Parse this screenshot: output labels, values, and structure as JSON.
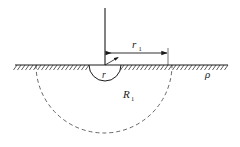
{
  "figure": {
    "background_color": "#ffffff",
    "stroke_color": "#1a1a1a",
    "width": 240,
    "height": 147
  },
  "labels": {
    "outer_radius": {
      "base": "r",
      "subscript": "1"
    },
    "inner_radius": {
      "base": "r",
      "subscript": ""
    },
    "hemisphere_radius": {
      "base": "R",
      "subscript": "1"
    },
    "soil_resistivity": {
      "base": "ρ",
      "subscript": ""
    }
  },
  "elements": {
    "ground_surface": {
      "name": "ground-surface-line",
      "x_start": 15,
      "x_end": 228,
      "y": 65,
      "hatch_side": "below",
      "hatch_spacing": 4,
      "hatch_length": 5
    },
    "vertical_lead": {
      "name": "vertical-lead-line",
      "x": 105,
      "y_top": 8,
      "y_bottom": 65
    },
    "dimension_arrow": {
      "name": "r1-dimension-arrow",
      "x_start": 105,
      "x_end": 168,
      "y": 53,
      "double_headed": true
    },
    "inner_semicircle": {
      "name": "inner-electrode-semicircle",
      "center_x": 105,
      "center_y": 65,
      "radius": 16,
      "style": "solid"
    },
    "inner_radius_arrow": {
      "name": "r-radius-arrow",
      "from_x": 105,
      "from_y": 65,
      "to_x": 119,
      "to_y": 57
    },
    "outer_semicircle": {
      "name": "outer-hemisphere-dashed-arc",
      "center_x": 104,
      "center_y": 65,
      "radius": 68,
      "style": "dashed",
      "dash_pattern": "4 3"
    }
  },
  "label_positions": {
    "r1": {
      "x": 132,
      "y": 48
    },
    "r": {
      "x": 105,
      "y": 78
    },
    "R1": {
      "x": 125,
      "y": 98
    },
    "rho": {
      "x": 208,
      "y": 76
    }
  }
}
